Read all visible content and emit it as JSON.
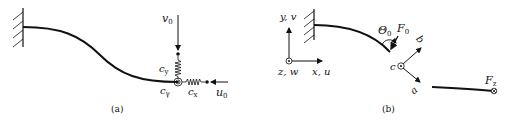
{
  "panel_a": {
    "caption": "(a)",
    "labels": {
      "v": "v",
      "v_sub": "0",
      "u": "u",
      "u_sub": "0",
      "cy": "c",
      "cy_sub": "y",
      "cx": "c",
      "cx_sub": "x",
      "cg": "c",
      "cg_sub": "γ"
    }
  },
  "panel_b": {
    "caption": "(b)",
    "labels": {
      "yv": "y, v",
      "zw": "z, w",
      "xu": "x, u",
      "theta": "Θ",
      "theta_sub": "0",
      "F0": "F",
      "F0_sub": "0",
      "b": "b",
      "c": "c",
      "a": "a",
      "Fz": "F",
      "Fz_sub": "z"
    }
  },
  "colors": {
    "stroke": "#111111",
    "background": "#ffffff"
  }
}
